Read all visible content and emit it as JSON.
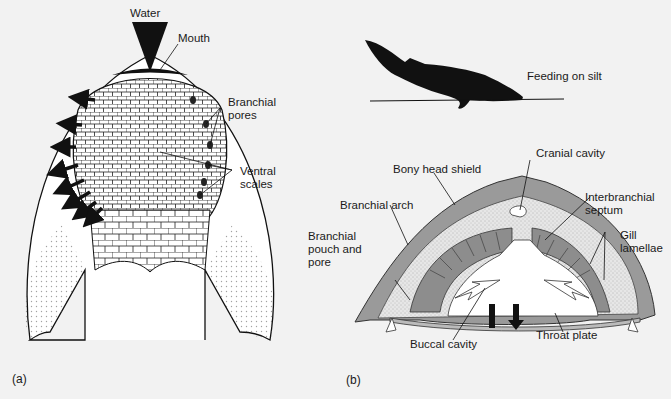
{
  "figure": {
    "panel_a": {
      "panel_label": "(a)",
      "labels": {
        "water": "Water",
        "mouth": "Mouth",
        "branchial_pores": "Branchial\npores",
        "ventral_scales": "Ventral\nscales"
      }
    },
    "panel_b": {
      "panel_label": "(b)",
      "labels": {
        "feeding": "Feeding on silt",
        "cranial_cavity": "Cranial cavity",
        "bony_head_shield": "Bony head shield",
        "interbranchial_septum": "Interbranchial\nseptum",
        "branchial_arch": "Branchial arch",
        "gill_lamellae": "Gill\nlamellae",
        "branchial_pouch": "Branchial\npouch and\npore",
        "buccal_cavity": "Buccal cavity",
        "throat_plate": "Throat plate"
      }
    },
    "colors": {
      "background": "#f2f2f2",
      "ink": "#111111",
      "shield_gray": "#9a9a9a",
      "stipple": "#d8d8d8",
      "bleed_text": "#d6d6d6"
    }
  }
}
